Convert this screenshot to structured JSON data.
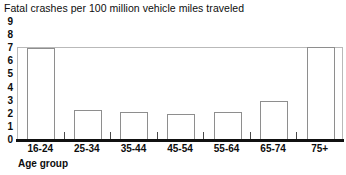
{
  "chart_data": {
    "type": "bar",
    "title": "Fatal crashes per 100 million vehicle miles traveled",
    "xlabel": "Age group",
    "ylabel": "",
    "categories": [
      "16-24",
      "25-34",
      "35-44",
      "45-54",
      "55-64",
      "65-74",
      "75+"
    ],
    "values": [
      7.0,
      2.3,
      2.1,
      2.0,
      2.1,
      3.0,
      8.0
    ],
    "ylim": [
      0,
      9
    ],
    "yticks": [
      0,
      1,
      2,
      3,
      4,
      5,
      6,
      7,
      8,
      9
    ],
    "ytick_labels": [
      "0",
      "1",
      "2",
      "3",
      "4",
      "5",
      "6",
      "7",
      "8",
      "9"
    ],
    "grid": false,
    "legend": null,
    "bar_face_color": "#ffffff",
    "bar_edge_color": "#8e8e8e",
    "axis_color": "#111111",
    "text_color": "#0d0d0d",
    "plot_frame_color": "#b9b9b9"
  }
}
